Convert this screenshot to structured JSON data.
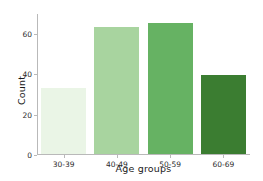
{
  "chart_data": {
    "type": "bar",
    "title": "",
    "subtitle": "",
    "xlabel": "Age groups",
    "ylabel": "Count",
    "categories": [
      "30-39",
      "40-49",
      "50-59",
      "60-69"
    ],
    "values": [
      33,
      63,
      65,
      39
    ],
    "series": [
      {
        "name": "Count",
        "values": [
          33,
          63,
          65,
          39
        ]
      }
    ],
    "yticks": [
      0,
      20,
      40,
      60
    ],
    "ytick_labels": [
      "0",
      "20",
      "40",
      "60"
    ],
    "ylim": [
      0,
      70
    ],
    "grid": false,
    "legend": null,
    "legend_position": "none",
    "annotations": [],
    "bar_colors": [
      "#eaf5e6",
      "#a8d49f",
      "#66b263",
      "#3b7d31"
    ],
    "palette": "Greens sequential",
    "axis_color": "#b9b9b9",
    "text_color": "#1a1a1a",
    "background": "#ffffff",
    "spines": [
      "left",
      "bottom"
    ]
  }
}
